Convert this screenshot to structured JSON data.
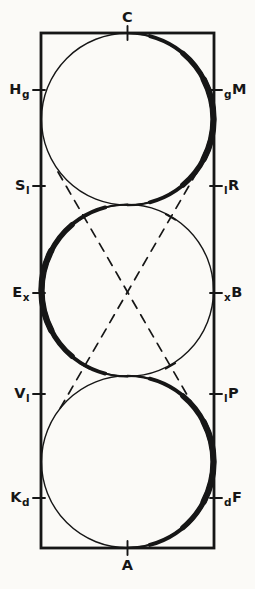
{
  "figure": {
    "labels": {
      "top": "C",
      "bottom": "A",
      "left": [
        {
          "main": "H",
          "sub": "g"
        },
        {
          "main": "S",
          "sub": "l"
        },
        {
          "main": "E",
          "sub": "x"
        },
        {
          "main": "V",
          "sub": "l"
        },
        {
          "main": "K",
          "sub": "d"
        }
      ],
      "right": [
        {
          "sub": "g",
          "main": "M"
        },
        {
          "sub": "l",
          "main": "R"
        },
        {
          "sub": "x",
          "main": "B"
        },
        {
          "sub": "l",
          "main": "P"
        },
        {
          "sub": "d",
          "main": "F"
        }
      ]
    },
    "colors": {
      "ink": "#161616",
      "background": "#fbfaf7"
    }
  }
}
